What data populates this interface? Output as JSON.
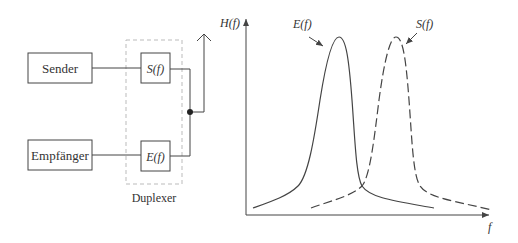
{
  "block_diagram": {
    "sender_label": "Sender",
    "receiver_label": "Empfänger",
    "transmit_filter_label": "S(f)",
    "receive_filter_label": "E(f)",
    "duplexer_label": "Duplexer",
    "antenna_icon": "antenna-arrow-icon"
  },
  "plot": {
    "y_axis_label": "H(f)",
    "x_axis_label": "f",
    "curves": [
      {
        "name": "E(f)",
        "label": "E(f)",
        "style": "solid"
      },
      {
        "name": "S(f)",
        "label": "S(f)",
        "style": "dashed"
      }
    ]
  },
  "colors": {
    "line": "#444444",
    "duplexer_border": "#bbbbbb",
    "text": "#333333"
  }
}
